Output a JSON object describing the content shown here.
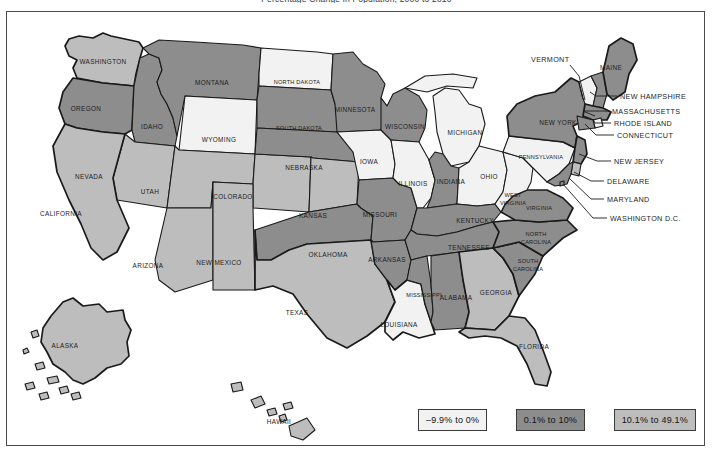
{
  "title": "Percentage Change in Population, 2000 to 2010",
  "legend": {
    "items": [
      {
        "label": "–9.9% to 0%",
        "color": "#f2f2f2"
      },
      {
        "label": "0.1% to 10%",
        "color": "#8d8d8d"
      },
      {
        "label": "10.1% to 49.1%",
        "color": "#bdbdbd"
      }
    ]
  },
  "colors": {
    "low": "#f2f2f2",
    "mid": "#8d8d8d",
    "high": "#bdbdbd",
    "outline": "#1a1a1a",
    "frame": "#4a4a4a",
    "background": "#ffffff"
  },
  "chart_data": {
    "type": "heatmap",
    "title": "Percentage Change in Population, 2000 to 2010",
    "xlabel": "",
    "ylabel": "",
    "legend_position": "bottom-right",
    "grid": false,
    "bins": [
      {
        "label": "–9.9% to 0%",
        "color": "#f2f2f2",
        "min": -9.9,
        "max": 0
      },
      {
        "label": "0.1% to 10%",
        "color": "#8d8d8d",
        "min": 0.1,
        "max": 10
      },
      {
        "label": "10.1% to 49.1%",
        "color": "#bdbdbd",
        "min": 10.1,
        "max": 49.1
      }
    ],
    "regions": [
      {
        "name": "WASHINGTON",
        "bin": 2
      },
      {
        "name": "OREGON",
        "bin": 1
      },
      {
        "name": "IDAHO",
        "bin": 1
      },
      {
        "name": "MONTANA",
        "bin": 1
      },
      {
        "name": "WYOMING",
        "bin": 0
      },
      {
        "name": "NEVADA",
        "bin": 2
      },
      {
        "name": "UTAH",
        "bin": 2
      },
      {
        "name": "CALIFORNIA",
        "bin": 2
      },
      {
        "name": "COLORADO",
        "bin": 2
      },
      {
        "name": "ARIZONA",
        "bin": 2
      },
      {
        "name": "NEW MEXICO",
        "bin": 2
      },
      {
        "name": "NORTH DAKOTA",
        "bin": 0
      },
      {
        "name": "SOUTH DAKOTA",
        "bin": 1
      },
      {
        "name": "NEBRASKA",
        "bin": 1
      },
      {
        "name": "KANSAS",
        "bin": 2
      },
      {
        "name": "OKLAHOMA",
        "bin": 1
      },
      {
        "name": "TEXAS",
        "bin": 2
      },
      {
        "name": "MINNESOTA",
        "bin": 1
      },
      {
        "name": "IOWA",
        "bin": 0
      },
      {
        "name": "MISSOURI",
        "bin": 1
      },
      {
        "name": "ARKANSAS",
        "bin": 1
      },
      {
        "name": "LOUISIANA",
        "bin": 0
      },
      {
        "name": "WISCONSIN",
        "bin": 1
      },
      {
        "name": "ILLINOIS",
        "bin": 0
      },
      {
        "name": "MICHIGAN",
        "bin": 0
      },
      {
        "name": "INDIANA",
        "bin": 1
      },
      {
        "name": "OHIO",
        "bin": 0
      },
      {
        "name": "KENTUCKY",
        "bin": 1
      },
      {
        "name": "TENNESSEE",
        "bin": 1
      },
      {
        "name": "MISSISSIPPI",
        "bin": 1
      },
      {
        "name": "ALABAMA",
        "bin": 1
      },
      {
        "name": "GEORGIA",
        "bin": 2
      },
      {
        "name": "FLORIDA",
        "bin": 2
      },
      {
        "name": "SOUTH CAROLINA",
        "bin": 1
      },
      {
        "name": "NORTH CAROLINA",
        "bin": 1
      },
      {
        "name": "VIRGINIA",
        "bin": 1
      },
      {
        "name": "WEST VIRGINIA",
        "bin": 0
      },
      {
        "name": "PENNSYLVANIA",
        "bin": 0
      },
      {
        "name": "NEW YORK",
        "bin": 1
      },
      {
        "name": "VERMONT",
        "bin": 0
      },
      {
        "name": "NEW HAMPSHIRE",
        "bin": 1
      },
      {
        "name": "MAINE",
        "bin": 1
      },
      {
        "name": "MASSACHUSETTS",
        "bin": 1
      },
      {
        "name": "RHODE ISLAND",
        "bin": 0
      },
      {
        "name": "CONNECTICUT",
        "bin": 1
      },
      {
        "name": "NEW JERSEY",
        "bin": 1
      },
      {
        "name": "DELAWARE",
        "bin": 2
      },
      {
        "name": "MARYLAND",
        "bin": 1
      },
      {
        "name": "WASHINGTON D.C.",
        "bin": 1
      },
      {
        "name": "ALASKA",
        "bin": 2
      },
      {
        "name": "HAWAII",
        "bin": 2
      }
    ]
  },
  "map_labels": {
    "inline": [
      {
        "name": "WASHINGTON",
        "x": 96,
        "y": 52
      },
      {
        "name": "OREGON",
        "x": 79,
        "y": 99
      },
      {
        "name": "IDAHO",
        "x": 145,
        "y": 117
      },
      {
        "name": "MONTANA",
        "x": 205,
        "y": 73
      },
      {
        "name": "WYOMING",
        "x": 212,
        "y": 130
      },
      {
        "name": "NEVADA",
        "x": 82,
        "y": 167
      },
      {
        "name": "UTAH",
        "x": 143,
        "y": 182
      },
      {
        "name": "CALIFORNIA",
        "x": 54,
        "y": 204
      },
      {
        "name": "COLORADO",
        "x": 226,
        "y": 187
      },
      {
        "name": "ARIZONA",
        "x": 141,
        "y": 256
      },
      {
        "name": "NEW MEXICO",
        "x": 212,
        "y": 253
      },
      {
        "name": "NORTH DAKOTA",
        "x": 290,
        "y": 72
      },
      {
        "name": "SOUTH DAKOTA",
        "x": 292,
        "y": 118
      },
      {
        "name": "NEBRASKA",
        "x": 297,
        "y": 158
      },
      {
        "name": "KANSAS",
        "x": 306,
        "y": 206
      },
      {
        "name": "OKLAHOMA",
        "x": 321,
        "y": 245
      },
      {
        "name": "TEXAS",
        "x": 290,
        "y": 303
      },
      {
        "name": "MINNESOTA",
        "x": 348,
        "y": 100
      },
      {
        "name": "IOWA",
        "x": 362,
        "y": 152
      },
      {
        "name": "MISSOURI",
        "x": 373,
        "y": 205
      },
      {
        "name": "ARKANSAS",
        "x": 380,
        "y": 250
      },
      {
        "name": "LOUISIANA",
        "x": 392,
        "y": 315
      },
      {
        "name": "WISCONSIN",
        "x": 398,
        "y": 117
      },
      {
        "name": "ILLINOIS",
        "x": 406,
        "y": 174
      },
      {
        "name": "MICHIGAN",
        "x": 458,
        "y": 123
      },
      {
        "name": "INDIANA",
        "x": 444,
        "y": 172
      },
      {
        "name": "OHIO",
        "x": 482,
        "y": 167
      },
      {
        "name": "KENTUCKY",
        "x": 468,
        "y": 211
      },
      {
        "name": "TENNESSEE",
        "x": 462,
        "y": 238
      },
      {
        "name": "MISSISSIPPI",
        "x": 417,
        "y": 285
      },
      {
        "name": "ALABAMA",
        "x": 449,
        "y": 288
      },
      {
        "name": "GEORGIA",
        "x": 489,
        "y": 283
      },
      {
        "name": "FLORIDA",
        "x": 527,
        "y": 337
      },
      {
        "name": "PENNSYLVANIA",
        "x": 534,
        "y": 147
      },
      {
        "name": "NEW YORK",
        "x": 551,
        "y": 113
      },
      {
        "name": "MAINE",
        "x": 604,
        "y": 58
      },
      {
        "name": "ALASKA",
        "x": 58,
        "y": 336
      },
      {
        "name": "HAWAII",
        "x": 272,
        "y": 412
      }
    ],
    "inline_multiline": [
      {
        "name": "WEST",
        "x": 506,
        "y": 185
      },
      {
        "name": "VIRGINIA",
        "x": 506,
        "y": 193
      },
      {
        "name": "VIRGINIA",
        "x": 532,
        "y": 198
      },
      {
        "name": "NORTH",
        "x": 529,
        "y": 224
      },
      {
        "name": "CAROLINA",
        "x": 529,
        "y": 232
      },
      {
        "name": "SOUTH",
        "x": 521,
        "y": 251
      },
      {
        "name": "CAROLINA",
        "x": 521,
        "y": 259
      }
    ],
    "callouts": [
      {
        "name": "VERMONT",
        "tx": 524,
        "ty": 50,
        "anchor": "start",
        "path": "M 563 53 L 572 64 L 578 88"
      },
      {
        "name": "NEW HAMPSHIRE",
        "tx": 613,
        "ty": 87,
        "anchor": "start",
        "path": "M 610 84 L 589 84 L 583 80"
      },
      {
        "name": "MASSACHUSETTS",
        "tx": 605,
        "ty": 102,
        "anchor": "start",
        "path": "M 602 99 L 576 99 L 588 104"
      },
      {
        "name": "RHODE ISLAND",
        "tx": 607,
        "ty": 114,
        "anchor": "start",
        "path": "M 604 111 L 588 111 L 586 107"
      },
      {
        "name": "CONNECTICUT",
        "tx": 610,
        "ty": 126,
        "anchor": "start",
        "path": "M 607 123 L 589 123 L 578 112"
      },
      {
        "name": "NEW JERSEY",
        "tx": 607,
        "ty": 152,
        "anchor": "start",
        "path": "M 604 149 L 590 149 L 572 142"
      },
      {
        "name": "DELAWARE",
        "tx": 600,
        "ty": 172,
        "anchor": "start",
        "path": "M 597 169 L 584 169 L 567 160"
      },
      {
        "name": "MARYLAND",
        "tx": 600,
        "ty": 190,
        "anchor": "start",
        "path": "M 597 187 L 584 187 L 562 166"
      },
      {
        "name": "WASHINGTON D.C.",
        "tx": 603,
        "ty": 209,
        "anchor": "start",
        "path": "M 600 206 L 586 206 L 556 172"
      }
    ]
  }
}
